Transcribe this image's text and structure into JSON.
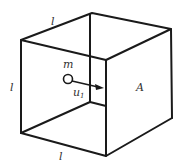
{
  "diagram": {
    "type": "cube-with-particle",
    "labels": {
      "edge_top": "l",
      "edge_left": "l",
      "edge_bottom": "l",
      "mass": "m",
      "velocity": "u",
      "velocity_subscript": "1",
      "face": "A"
    },
    "colors": {
      "line": "#1a1a1a",
      "text": "#333333",
      "background": "#ffffff"
    }
  }
}
